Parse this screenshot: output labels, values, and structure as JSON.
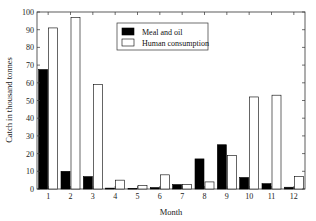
{
  "chart_data": {
    "type": "bar",
    "title": "",
    "xlabel": "Month",
    "ylabel": "Catch in thousand tonnes",
    "categories": [
      "1",
      "2",
      "3",
      "4",
      "5",
      "6",
      "7",
      "8",
      "9",
      "10",
      "11",
      "12"
    ],
    "series": [
      {
        "name": "Meal and oil",
        "color": "#000000",
        "values": [
          67.5,
          10,
          7,
          0.5,
          0.3,
          0.8,
          2.5,
          17,
          25,
          6.5,
          3,
          1
        ]
      },
      {
        "name": "Human consumption",
        "color": "#ffffff",
        "values": [
          91,
          97,
          59,
          5,
          2,
          8,
          2.5,
          4,
          19,
          52,
          53,
          7
        ]
      }
    ],
    "ylim": [
      0,
      100
    ],
    "yticks": [
      0,
      10,
      20,
      30,
      40,
      50,
      60,
      70,
      80,
      90,
      100
    ],
    "grid": false,
    "legend_position": "upper center"
  },
  "legend": {
    "items": [
      {
        "label": "Meal and oil",
        "swatch": "filled"
      },
      {
        "label": "Human consumption",
        "swatch": "open"
      }
    ]
  }
}
